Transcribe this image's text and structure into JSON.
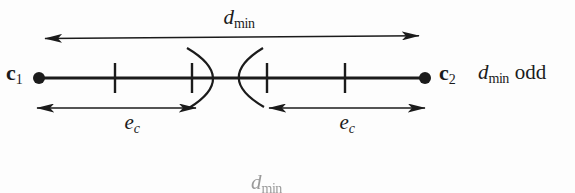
{
  "figure": {
    "colors": {
      "ink": "#1b1b1b",
      "paper": "#fdfdfd",
      "faded": "#9a9a9a"
    },
    "labels": {
      "c1": {
        "base": "c",
        "sub": "1"
      },
      "c2": {
        "base": "c",
        "sub": "2"
      },
      "dmin": {
        "base": "d",
        "sub": "min"
      },
      "note": {
        "base": "d",
        "sub": "min",
        "word": "odd"
      },
      "ec_left": {
        "base": "e",
        "sub": "c"
      },
      "ec_right": {
        "base": "e",
        "sub": "c"
      },
      "partial_next": {
        "base": "d",
        "sub": "min"
      }
    }
  }
}
